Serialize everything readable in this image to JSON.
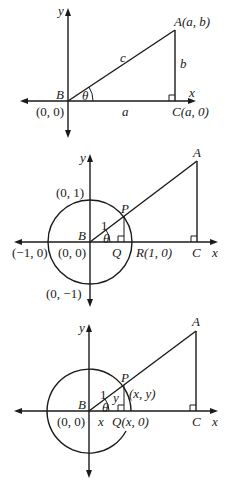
{
  "diagram1": {
    "axis_x_label": "x",
    "axis_y_label": "y",
    "vertex_B": "B",
    "vertex_A": "A(a, b)",
    "vertex_C": "C(a, 0)",
    "origin": "(0, 0)",
    "side_a": "a",
    "side_b": "b",
    "side_c": "c",
    "angle": "θ"
  },
  "diagram2": {
    "axis_x_label": "x",
    "axis_y_label": "y",
    "vertex_A": "A",
    "vertex_B": "B",
    "vertex_C": "C",
    "point_P": "P",
    "point_Q": "Q",
    "point_R": "R(1, 0)",
    "origin": "(0, 0)",
    "top": "(0, 1)",
    "bottom": "(0, −1)",
    "left": "(−1, 0)",
    "radius": "1",
    "angle": "θ"
  },
  "diagram3": {
    "axis_x_label": "x",
    "axis_y_label": "y",
    "vertex_A": "A",
    "vertex_B": "B",
    "vertex_C": "C",
    "point_P": "P",
    "point_P_coords": "(x, y)",
    "point_Q": "Q(x, 0)",
    "origin": "(0, 0)",
    "radius": "1",
    "side_x": "x",
    "side_y": "y",
    "angle": "θ"
  }
}
